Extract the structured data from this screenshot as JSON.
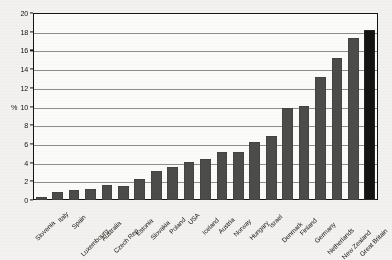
{
  "chart_data": {
    "type": "bar",
    "title": "",
    "xlabel": "",
    "ylabel": "%",
    "ylim": [
      0,
      20
    ],
    "ytick_step": 2,
    "yticks": [
      0,
      2,
      4,
      6,
      8,
      10,
      12,
      14,
      16,
      18,
      20
    ],
    "grid": true,
    "legend": "none",
    "bar_color": "#4c4c4a",
    "highlight_color": "#141414",
    "highlight_category": "Great Britain",
    "categories": [
      "Slovenia",
      "Italy",
      "Spain",
      "Luxembourg",
      "Australia",
      "Czech Rep.",
      "Estonia",
      "Slovakia",
      "Poland",
      "USA",
      "Iceland",
      "Austria",
      "Norway",
      "Hungary",
      "Israel",
      "Denmark",
      "Finland",
      "Germany",
      "Netherlands",
      "New Zealand",
      "Great Britain"
    ],
    "values": [
      0.35,
      0.9,
      1.05,
      1.2,
      1.6,
      1.55,
      2.25,
      3.15,
      3.55,
      4.05,
      4.4,
      5.1,
      5.1,
      6.2,
      6.8,
      9.8,
      10.1,
      13.2,
      15.2,
      17.3,
      18.2
    ]
  }
}
